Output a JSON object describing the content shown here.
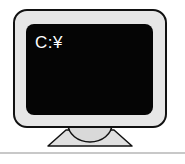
{
  "monitor": {
    "screen_text": "C:¥",
    "colors": {
      "bezel": "#e6e6e6",
      "outline": "#111111",
      "screen": "#050505",
      "stand": "#d9d9d9",
      "base": "#e0e0e0",
      "text": "#ffffff",
      "rule": "#c8c8c8"
    }
  }
}
